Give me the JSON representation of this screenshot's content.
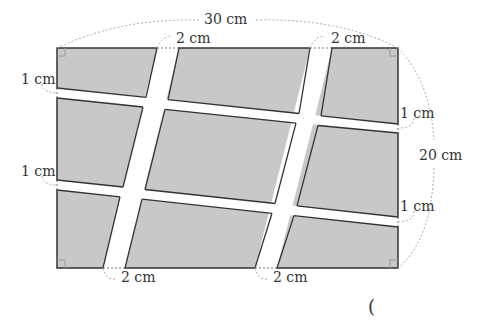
{
  "figure": {
    "type": "rectangular field crossed by two slanted vertical roads and two slanted horizontal roads",
    "field_color": "#c8c8c8",
    "road_color": "#ffffff",
    "outline_color": "#333333",
    "dimension_line_color": "#9a9a9a"
  },
  "dimensions": {
    "width_label": "30 cm",
    "height_label": "20 cm",
    "vertical_road_width_labels": [
      "2 cm",
      "2 cm",
      "2 cm",
      "2 cm"
    ],
    "horizontal_road_width_labels": [
      "1 cm",
      "1 cm",
      "1 cm",
      "1 cm"
    ]
  },
  "answer": {
    "open_paren": "("
  }
}
